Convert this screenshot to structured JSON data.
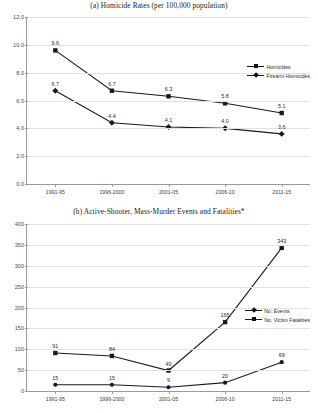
{
  "figure": {
    "panels": [
      {
        "id": "panel-a",
        "title": "(a) Homicide Rates (per 100,000 population)"
      },
      {
        "id": "panel-b",
        "title": "(b) Active-Shooter, Mass-Murder Events and Fatalities*"
      }
    ]
  },
  "chart_data": [
    {
      "type": "line",
      "title": "(a) Homicide Rates (per 100,000 population)",
      "xlabel": "",
      "ylabel": "",
      "categories": [
        "1991-95",
        "1996-2000",
        "2001-05",
        "2006-10",
        "2011-15"
      ],
      "ylim": [
        0.0,
        12.0
      ],
      "yticks": [
        "0.0",
        "2.0",
        "4.0",
        "6.0",
        "8.0",
        "10.0",
        "12.0"
      ],
      "ytick_values": [
        0.0,
        2.0,
        4.0,
        6.0,
        8.0,
        10.0,
        12.0
      ],
      "grid": true,
      "legend_position": "right",
      "series": [
        {
          "name": "Homicides",
          "marker": "square",
          "values": [
            9.6,
            6.7,
            6.3,
            5.8,
            5.1
          ],
          "labels": [
            "9.6",
            "6.7",
            "6.3",
            "5.8",
            "5.1"
          ]
        },
        {
          "name": "Firearm Homicides",
          "marker": "diamond",
          "values": [
            6.7,
            4.4,
            4.1,
            4.0,
            3.6
          ],
          "labels": [
            "6.7",
            "4.4",
            "4.1",
            "4.0",
            "3.6"
          ]
        }
      ]
    },
    {
      "type": "line",
      "title": "(b) Active-Shooter, Mass-Murder Events and Fatalities*",
      "xlabel": "",
      "ylabel": "",
      "categories": [
        "1991-95",
        "1996-2000",
        "2001-05",
        "2006-10",
        "2011-15"
      ],
      "ylim": [
        0,
        400
      ],
      "yticks": [
        "0",
        "50",
        "100",
        "150",
        "200",
        "250",
        "300",
        "350",
        "400"
      ],
      "ytick_values": [
        0,
        50,
        100,
        150,
        200,
        250,
        300,
        350,
        400
      ],
      "grid": true,
      "legend_position": "right",
      "series": [
        {
          "name": "No. Events",
          "marker": "circle",
          "values": [
            15,
            15,
            9,
            20,
            69
          ],
          "labels": [
            "15",
            "15",
            "9",
            "20",
            "69"
          ]
        },
        {
          "name": "No. Victim Fatalities",
          "marker": "square",
          "values": [
            91,
            84,
            49,
            165,
            343
          ],
          "labels": [
            "91",
            "84",
            "49",
            "165",
            "343"
          ]
        }
      ]
    }
  ],
  "colors": {
    "line": "#1a1a1a",
    "grid": "#e2e2e2",
    "axis": "#9a9a9a",
    "text": "#1a1a1a",
    "background": "#ffffff"
  }
}
